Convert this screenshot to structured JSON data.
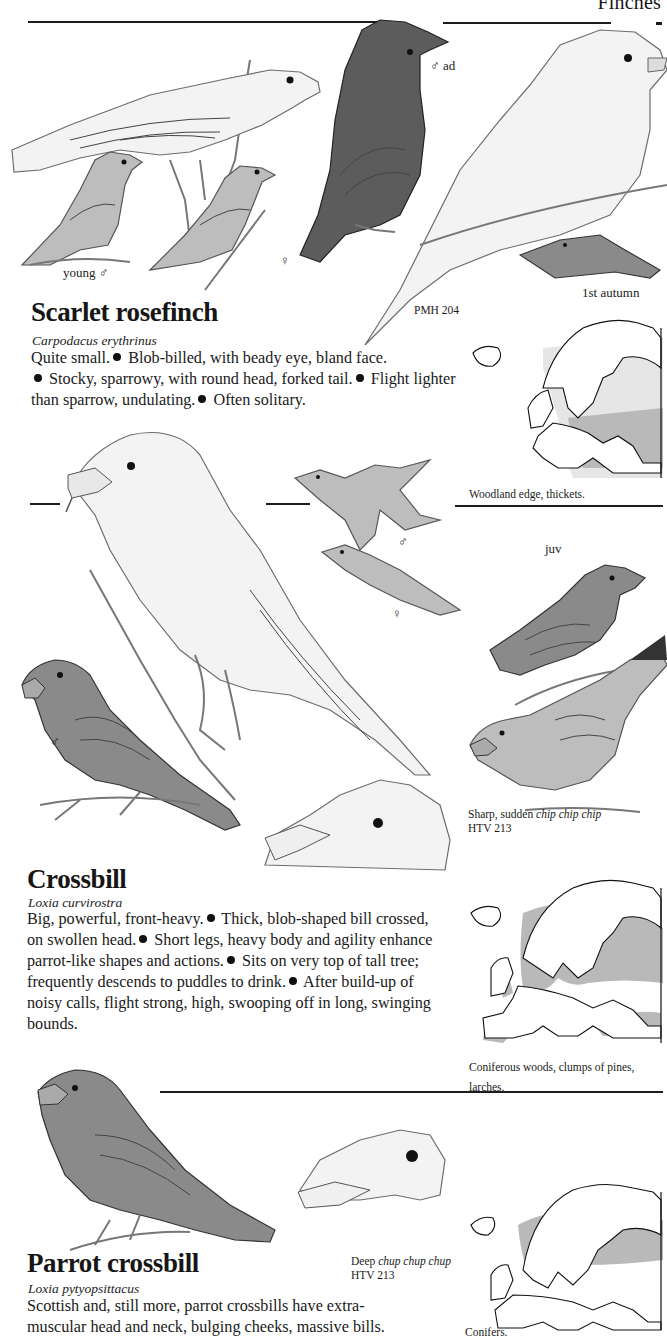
{
  "page": {
    "header": "Finches"
  },
  "species": [
    {
      "name": "Scarlet rosefinch",
      "scientific": "Carpodacus erythrinus",
      "plate_ref": "PMH 204",
      "description_segments": [
        "Quite small.",
        "Blob-billed, with beady eye, bland face.",
        "Stocky, sparrowy, with round head, forked tail.",
        "Flight lighter than sparrow, undulating.",
        "Often solitary."
      ],
      "illustration_labels": {
        "male_adult": "♂ ad",
        "young_male": "young ♂",
        "female": "♀",
        "first_autumn": "1st autumn"
      },
      "map": {
        "habitat": "Woodland edge, thickets."
      }
    },
    {
      "name": "Crossbill",
      "scientific": "Loxia curvirostra",
      "description_segments": [
        "Big, powerful, front-heavy.",
        "Thick, blob-shaped bill crossed, on swollen head.",
        "Short legs, heavy body and agility enhance parrot-like shapes and actions.",
        "Sits on very top of tall tree; frequently descends to puddles to drink.",
        "After build-up of noisy calls, flight strong, high, swooping off in long, swinging bounds."
      ],
      "illustration_labels": {
        "flight_male": "♂",
        "flight_female": "♀",
        "juvenile": "juv",
        "perched_male": "♂"
      },
      "call": {
        "prefix": "Sharp, sudden ",
        "call_text": "chip chip chip",
        "ref": "HTV 213"
      },
      "map": {
        "habitat_line1": "Coniferous woods, clumps of pines,",
        "habitat_line2": "larches."
      }
    },
    {
      "name": "Parrot crossbill",
      "scientific": "Loxia pytyopsittacus",
      "description_segments": [
        "Scottish and, still more, parrot crossbills have extra-",
        "muscular head and neck, bulging cheeks, massive bills."
      ],
      "call": {
        "prefix": "Deep ",
        "call_text": "chup chup chup",
        "ref": "HTV 213"
      },
      "map": {
        "habitat": "Conifers."
      }
    }
  ]
}
